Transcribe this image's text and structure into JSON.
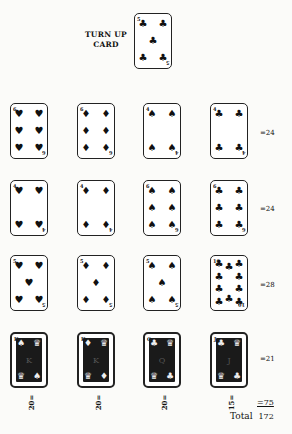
{
  "turn_up": {
    "label_line1": "TURN UP",
    "label_line2": "CARD",
    "card": {
      "rank": "5",
      "suit": "clubs",
      "symbol": "♣"
    }
  },
  "rows": [
    {
      "cards": [
        {
          "rank": "6",
          "suit": "hearts",
          "symbol": "♥"
        },
        {
          "rank": "6",
          "suit": "diamonds",
          "symbol": "♦"
        },
        {
          "rank": "4",
          "suit": "spades",
          "symbol": "♠"
        },
        {
          "rank": "4",
          "suit": "clubs",
          "symbol": "♣"
        }
      ],
      "score": "=24"
    },
    {
      "cards": [
        {
          "rank": "4",
          "suit": "hearts",
          "symbol": "♥"
        },
        {
          "rank": "4",
          "suit": "diamonds",
          "symbol": "♦"
        },
        {
          "rank": "6",
          "suit": "spades",
          "symbol": "♠"
        },
        {
          "rank": "6",
          "suit": "clubs",
          "symbol": "♣"
        }
      ],
      "score": "=24"
    },
    {
      "cards": [
        {
          "rank": "5",
          "suit": "hearts",
          "symbol": "♥"
        },
        {
          "rank": "5",
          "suit": "diamonds",
          "symbol": "♦"
        },
        {
          "rank": "5",
          "suit": "spades",
          "symbol": "♠"
        },
        {
          "rank": "10",
          "suit": "clubs",
          "symbol": "♣"
        }
      ],
      "score": "=28"
    },
    {
      "cards": [
        {
          "rank": "K",
          "suit": "spades",
          "symbol": "♠",
          "face": true
        },
        {
          "rank": "K",
          "suit": "diamonds",
          "symbol": "♦",
          "face": true
        },
        {
          "rank": "Q",
          "suit": "clubs",
          "symbol": "♣",
          "face": true
        },
        {
          "rank": "J",
          "suit": "clubs",
          "symbol": "♣",
          "face": true
        }
      ],
      "score": "=21"
    }
  ],
  "column_scores": [
    "20=",
    "20=",
    "20=",
    "15="
  ],
  "column_sum": "=75",
  "total_label": "Total",
  "total_value": "172"
}
